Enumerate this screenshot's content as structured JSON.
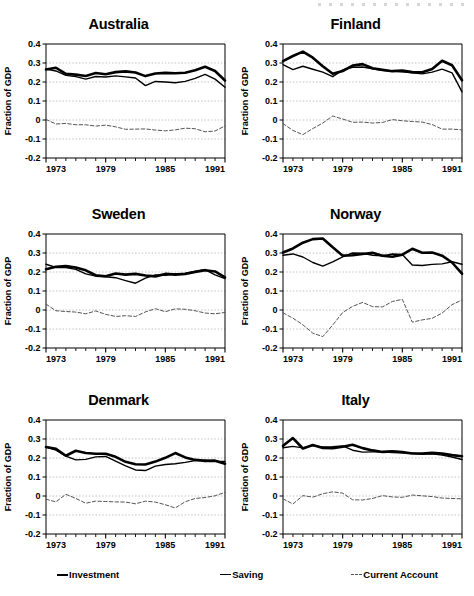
{
  "figure": {
    "ylabel": "Fraction of GDP",
    "ytick_labels": [
      "0.4",
      "0.3",
      "0.2",
      "0.1",
      "0",
      "-0.1",
      "-0.2"
    ],
    "xtick_labels": [
      "1973",
      "1979",
      "1985",
      "1991"
    ],
    "colors": {
      "investment": "#000000",
      "saving": "#000000",
      "current_account": "#555555",
      "grid": "#bbbbbb",
      "axis": "#000000"
    }
  },
  "legend": {
    "items": [
      {
        "label": "Investment",
        "icon": "solid-thick-line-icon"
      },
      {
        "label": "Saving",
        "icon": "solid-thin-line-icon"
      },
      {
        "label": "Current Account",
        "icon": "dashed-line-icon"
      }
    ]
  },
  "chart_data": {
    "type": "line",
    "xlabel": "",
    "ylabel": "Fraction of GDP",
    "xlim": [
      1973,
      1991
    ],
    "ylim": [
      -0.2,
      0.4
    ],
    "yticks": [
      0.4,
      0.3,
      0.2,
      0.1,
      0,
      -0.1,
      -0.2
    ],
    "xticks": [
      1973,
      1979,
      1985,
      1991
    ],
    "xtick_all": [
      1973,
      1974,
      1975,
      1976,
      1977,
      1978,
      1979,
      1980,
      1981,
      1982,
      1983,
      1984,
      1985,
      1986,
      1987,
      1988,
      1989,
      1990,
      1991
    ],
    "grid": "horizontal-dotted",
    "legend_position": "bottom",
    "x": [
      1973,
      1974,
      1975,
      1976,
      1977,
      1978,
      1979,
      1980,
      1981,
      1982,
      1983,
      1984,
      1985,
      1986,
      1987,
      1988,
      1989,
      1990,
      1991
    ],
    "panels": [
      {
        "name": "Australia",
        "series": [
          {
            "name": "Investment",
            "values": [
              0.266,
              0.275,
              0.243,
              0.239,
              0.232,
              0.247,
              0.241,
              0.252,
              0.256,
              0.25,
              0.231,
              0.245,
              0.248,
              0.246,
              0.249,
              0.262,
              0.28,
              0.258,
              0.208
            ]
          },
          {
            "name": "Saving",
            "values": [
              0.268,
              0.258,
              0.235,
              0.228,
              0.215,
              0.229,
              0.226,
              0.232,
              0.227,
              0.221,
              0.181,
              0.203,
              0.2,
              0.196,
              0.203,
              0.219,
              0.24,
              0.215,
              0.172
            ]
          },
          {
            "name": "Current Account",
            "values": [
              0.003,
              -0.021,
              -0.018,
              -0.025,
              -0.025,
              -0.032,
              -0.027,
              -0.036,
              -0.049,
              -0.048,
              -0.047,
              -0.053,
              -0.057,
              -0.052,
              -0.043,
              -0.046,
              -0.062,
              -0.058,
              -0.031
            ]
          }
        ]
      },
      {
        "name": "Finland",
        "series": [
          {
            "name": "Investment",
            "values": [
              0.31,
              0.337,
              0.36,
              0.328,
              0.283,
              0.243,
              0.258,
              0.286,
              0.294,
              0.272,
              0.264,
              0.257,
              0.26,
              0.252,
              0.251,
              0.268,
              0.312,
              0.288,
              0.209
            ]
          },
          {
            "name": "Saving",
            "values": [
              0.291,
              0.265,
              0.283,
              0.267,
              0.252,
              0.228,
              0.264,
              0.277,
              0.279,
              0.27,
              0.262,
              0.258,
              0.254,
              0.248,
              0.243,
              0.252,
              0.268,
              0.248,
              0.148
            ]
          },
          {
            "name": "Current Account",
            "values": [
              -0.019,
              -0.055,
              -0.077,
              -0.045,
              -0.016,
              0.021,
              0.005,
              -0.012,
              -0.011,
              -0.016,
              -0.013,
              0.002,
              -0.004,
              -0.008,
              -0.011,
              -0.024,
              -0.048,
              -0.048,
              -0.052
            ]
          }
        ]
      },
      {
        "name": "Sweden",
        "series": [
          {
            "name": "Investment",
            "values": [
              0.215,
              0.228,
              0.231,
              0.224,
              0.209,
              0.183,
              0.178,
              0.192,
              0.186,
              0.19,
              0.182,
              0.177,
              0.19,
              0.186,
              0.19,
              0.2,
              0.209,
              0.203,
              0.172
            ]
          },
          {
            "name": "Saving",
            "values": [
              0.241,
              0.224,
              0.224,
              0.214,
              0.19,
              0.178,
              0.175,
              0.17,
              0.155,
              0.141,
              0.168,
              0.185,
              0.182,
              0.191,
              0.192,
              0.204,
              0.213,
              0.185,
              0.165
            ]
          },
          {
            "name": "Current Account",
            "values": [
              0.031,
              -0.004,
              -0.008,
              -0.011,
              -0.02,
              -0.005,
              -0.023,
              -0.034,
              -0.03,
              -0.034,
              -0.01,
              0.007,
              -0.009,
              0.006,
              0.004,
              -0.004,
              -0.016,
              -0.02,
              -0.013
            ]
          }
        ]
      },
      {
        "name": "Norway",
        "series": [
          {
            "name": "Investment",
            "values": [
              0.303,
              0.324,
              0.354,
              0.373,
              0.376,
              0.33,
              0.286,
              0.288,
              0.295,
              0.301,
              0.286,
              0.28,
              0.291,
              0.322,
              0.301,
              0.303,
              0.286,
              0.25,
              0.191
            ]
          },
          {
            "name": "Saving",
            "values": [
              0.288,
              0.295,
              0.279,
              0.25,
              0.231,
              0.253,
              0.28,
              0.3,
              0.299,
              0.288,
              0.285,
              0.295,
              0.292,
              0.237,
              0.234,
              0.24,
              0.243,
              0.254,
              0.241
            ]
          },
          {
            "name": "Current Account",
            "values": [
              -0.015,
              -0.043,
              -0.078,
              -0.122,
              -0.14,
              -0.079,
              -0.013,
              0.019,
              0.04,
              0.018,
              0.016,
              0.045,
              0.056,
              -0.064,
              -0.052,
              -0.044,
              -0.016,
              0.028,
              0.053
            ]
          }
        ]
      },
      {
        "name": "Denmark",
        "series": [
          {
            "name": "Investment",
            "values": [
              0.258,
              0.248,
              0.212,
              0.238,
              0.226,
              0.222,
              0.222,
              0.206,
              0.18,
              0.167,
              0.166,
              0.181,
              0.201,
              0.226,
              0.203,
              0.19,
              0.185,
              0.186,
              0.17
            ]
          },
          {
            "name": "Saving",
            "values": [
              0.259,
              0.241,
              0.21,
              0.19,
              0.193,
              0.206,
              0.208,
              0.184,
              0.159,
              0.137,
              0.134,
              0.157,
              0.166,
              0.17,
              0.177,
              0.186,
              0.189,
              0.183,
              0.182
            ]
          },
          {
            "name": "Current Account",
            "values": [
              -0.017,
              -0.031,
              0.009,
              -0.013,
              -0.038,
              -0.027,
              -0.029,
              -0.031,
              -0.032,
              -0.041,
              -0.027,
              -0.032,
              -0.046,
              -0.063,
              -0.03,
              -0.013,
              -0.008,
              0.001,
              0.019
            ]
          }
        ]
      },
      {
        "name": "Italy",
        "series": [
          {
            "name": "Investment",
            "values": [
              0.264,
              0.305,
              0.25,
              0.268,
              0.253,
              0.252,
              0.259,
              0.27,
              0.252,
              0.24,
              0.232,
              0.235,
              0.231,
              0.224,
              0.224,
              0.227,
              0.223,
              0.215,
              0.209
            ]
          },
          {
            "name": "Saving",
            "values": [
              0.254,
              0.261,
              0.253,
              0.265,
              0.258,
              0.26,
              0.264,
              0.241,
              0.231,
              0.232,
              0.233,
              0.229,
              0.227,
              0.225,
              0.22,
              0.222,
              0.215,
              0.205,
              0.192
            ]
          },
          {
            "name": "Current Account",
            "values": [
              -0.015,
              -0.042,
              0.002,
              -0.006,
              0.012,
              0.022,
              0.015,
              -0.02,
              -0.021,
              -0.013,
              0.002,
              -0.005,
              -0.007,
              0.005,
              0.001,
              -0.003,
              -0.011,
              -0.013,
              -0.015
            ]
          }
        ]
      }
    ]
  }
}
